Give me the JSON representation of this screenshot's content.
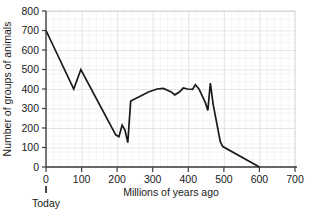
{
  "chart_data": {
    "type": "line",
    "title": "",
    "xlabel": "Millions of years ago",
    "ylabel": "Number of groups of animals",
    "xlim": [
      0,
      700
    ],
    "ylim": [
      0,
      800
    ],
    "xticks": [
      0,
      100,
      200,
      300,
      400,
      500,
      600,
      700
    ],
    "xtick_labels": [
      "0",
      "100",
      "200",
      "300",
      "400",
      "500",
      "600",
      "700"
    ],
    "yticks": [
      0,
      100,
      200,
      300,
      400,
      500,
      600,
      700,
      800
    ],
    "ytick_labels": [
      "0",
      "100",
      "200",
      "300",
      "400",
      "500",
      "600",
      "700",
      "800"
    ],
    "grid": "fine graph-paper grid, minor every 20 x-units and 20 y-units, major every 100",
    "legend": "none",
    "legend_position": "none",
    "series": [
      {
        "name": "Number of groups of animals",
        "color": "#1a1a1a",
        "x": [
          0,
          78,
          98,
          196,
          205,
          214,
          222,
          230,
          238,
          262,
          288,
          312,
          330,
          352,
          362,
          374,
          386,
          398,
          412,
          420,
          430,
          448,
          455,
          462,
          470,
          490,
          497,
          600
        ],
        "y": [
          700,
          400,
          500,
          165,
          155,
          215,
          190,
          125,
          338,
          360,
          385,
          400,
          403,
          385,
          370,
          383,
          405,
          400,
          398,
          422,
          400,
          330,
          290,
          430,
          320,
          130,
          105,
          0
        ]
      }
    ],
    "annotations": [
      {
        "name": "today-marker",
        "text": "Today",
        "x": 0,
        "y": 0,
        "note": "small vertical tick below the x-axis at 0 million years ago"
      }
    ]
  },
  "axes": {
    "y_title": "Number of groups of animals",
    "x_title": "Millions of years ago"
  },
  "colors": {
    "line": "#1a1a1a",
    "axis": "#4d4d4d",
    "grid_minor": "#e2e2e8",
    "grid_major": "#c9c9d2",
    "text": "#1a1a1a",
    "background": "#ffffff"
  }
}
